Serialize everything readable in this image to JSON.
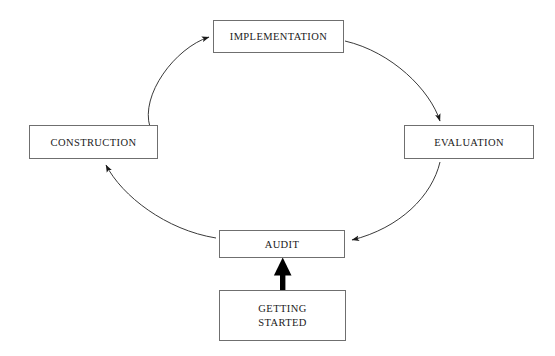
{
  "diagram": {
    "background_color": "#ffffff",
    "box_border_color": "#6f6f6f",
    "arc_color": "#3a3a3a",
    "bold_arrow_color": "#000000",
    "nodes": [
      {
        "id": "implementation",
        "label": "IMPLEMENTATION",
        "position": "top",
        "x": 213,
        "y": 20,
        "width": 131,
        "height": 33
      },
      {
        "id": "evaluation",
        "label": "EVALUATION",
        "position": "right",
        "x": 404,
        "y": 125,
        "width": 130,
        "height": 34
      },
      {
        "id": "audit",
        "label": "AUDIT",
        "position": "bottom",
        "x": 219,
        "y": 230,
        "width": 126,
        "height": 28
      },
      {
        "id": "construction",
        "label": "CONSTRUCTION",
        "position": "left",
        "x": 29,
        "y": 125,
        "width": 129,
        "height": 34
      },
      {
        "id": "getting-started",
        "label": "GETTING\nSTARTED",
        "position": "entry",
        "x": 219,
        "y": 290,
        "width": 127,
        "height": 51
      }
    ],
    "connectors": [
      {
        "id": "implementation-to-evaluation",
        "from": "implementation",
        "to": "evaluation",
        "style": "arc",
        "direction": "clockwise",
        "arrowhead": "at-evaluation-top"
      },
      {
        "id": "evaluation-to-audit",
        "from": "evaluation",
        "to": "audit",
        "style": "arc",
        "direction": "clockwise",
        "arrowhead": "at-audit-right"
      },
      {
        "id": "audit-to-construction",
        "from": "audit",
        "to": "construction",
        "style": "arc",
        "direction": "clockwise",
        "arrowhead": "at-construction-bottom"
      },
      {
        "id": "construction-to-implementation",
        "from": "construction",
        "to": "implementation",
        "style": "arc",
        "direction": "clockwise",
        "arrowhead": "at-implementation-left"
      },
      {
        "id": "getting-started-to-audit",
        "from": "getting-started",
        "to": "audit",
        "style": "bold-straight-arrow",
        "direction": "upward",
        "arrowhead": "at-audit-bottom"
      }
    ]
  }
}
